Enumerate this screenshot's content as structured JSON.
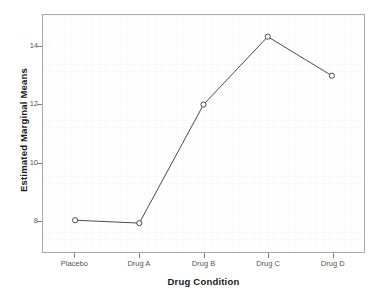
{
  "chart_data": {
    "type": "line",
    "title": "",
    "xlabel": "Drug Condition",
    "ylabel": "Estimated Marginal Means",
    "categories": [
      "Placebo",
      "Drug A",
      "Drug B",
      "Drug C",
      "Drug D"
    ],
    "values": [
      8.0,
      7.9,
      12.0,
      14.35,
      13.0
    ],
    "series": [
      {
        "name": "Estimated Marginal Means",
        "values": [
          8.0,
          7.9,
          12.0,
          14.35,
          13.0
        ]
      }
    ],
    "ylim": [
      6.9,
      15.1
    ],
    "yticks": [
      8,
      10,
      12,
      14
    ],
    "ytick_labels": [
      "8",
      "10",
      "12",
      "14"
    ],
    "xtick_labels": [
      "Placebo",
      "Drug A",
      "Drug B",
      "Drug C",
      "Drug D"
    ],
    "grid": true,
    "legend": false,
    "legend_position": "none",
    "marker": "open-circle",
    "line_color": "#4a4a4a",
    "marker_color": "#4a4a4a",
    "frame_color": "#a9a9a9",
    "plot_background": "#ffffff",
    "annotations": []
  }
}
